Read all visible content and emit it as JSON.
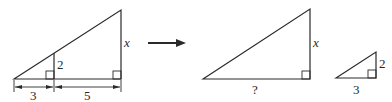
{
  "diagram": {
    "type": "similar-triangles",
    "left_figure": {
      "labels": {
        "small_base": "3",
        "large_base_extension": "5",
        "small_height": "2",
        "large_height": "x"
      }
    },
    "arrow": {
      "direction": "right"
    },
    "large_triangle": {
      "labels": {
        "height": "x",
        "base": "?"
      }
    },
    "small_triangle": {
      "labels": {
        "height": "2",
        "base": "3"
      }
    }
  },
  "colors": {
    "stroke": "#2a2a2a",
    "background": "#ffffff"
  }
}
